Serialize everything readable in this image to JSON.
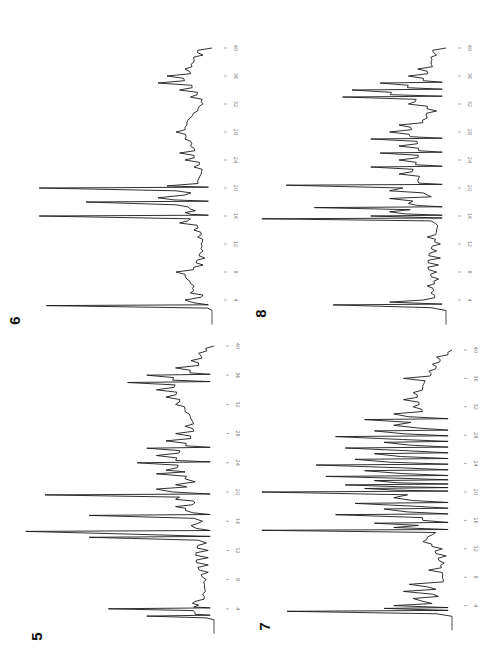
{
  "figure": {
    "orientation": "rotated 90 degrees (time axis vertical, increasing upward)",
    "tick_values": [
      4,
      8,
      12,
      16,
      20,
      24,
      28,
      32,
      36,
      40
    ]
  },
  "chart_data": [
    {
      "type": "line",
      "panel_label": "6",
      "title": "6",
      "xlabel": "",
      "ylabel": "",
      "x_ticks": [
        4,
        8,
        12,
        16,
        20,
        24,
        28,
        32,
        36,
        40
      ],
      "xlim": [
        2,
        42
      ],
      "x": [
        2.5,
        3.2,
        3.6,
        4.0,
        4.4,
        5,
        6,
        7,
        8,
        9,
        10,
        11,
        12,
        13,
        14,
        15,
        15.6,
        16,
        16.5,
        17,
        17.6,
        18,
        18.6,
        19,
        19.6,
        20,
        20.3,
        21,
        22,
        23,
        24,
        25,
        26,
        27,
        28,
        29,
        30,
        31,
        32,
        33,
        34,
        35,
        36,
        37,
        38,
        39,
        40
      ],
      "values": [
        0,
        0.92,
        0.1,
        0.15,
        0.06,
        0.12,
        0.1,
        0.14,
        0.2,
        0.05,
        0.04,
        0.05,
        0.06,
        0.08,
        0.1,
        0.18,
        0.12,
        0.96,
        0.15,
        0.12,
        0.2,
        0.7,
        0.3,
        0.15,
        0.2,
        0.96,
        0.25,
        0.08,
        0.06,
        0.1,
        0.15,
        0.18,
        0.12,
        0.15,
        0.2,
        0.14,
        0.12,
        0.08,
        0.05,
        0.12,
        0.18,
        0.3,
        0.25,
        0.15,
        0.1,
        0.05,
        0.0
      ],
      "values_unit": "relative detector response (0-1)"
    },
    {
      "type": "line",
      "panel_label": "8",
      "title": "8",
      "xlabel": "",
      "ylabel": "",
      "x_ticks": [
        4,
        8,
        12,
        16,
        20,
        24,
        28,
        32,
        36,
        40
      ],
      "xlim": [
        2,
        42
      ],
      "x": [
        2.5,
        3.3,
        3.7,
        4.0,
        5,
        6,
        7,
        8,
        9,
        10,
        11,
        12,
        13,
        14,
        15,
        15.6,
        16,
        16.6,
        17.2,
        17.8,
        18.5,
        19,
        19.6,
        20.4,
        21,
        22,
        23,
        24,
        25,
        26,
        27,
        28,
        29,
        30,
        31,
        32,
        33,
        34,
        35,
        36,
        37,
        38,
        39,
        40
      ],
      "values": [
        0,
        0.6,
        0.3,
        0.12,
        0.08,
        0.1,
        0.04,
        0.05,
        0.04,
        0.03,
        0.05,
        0.03,
        0.1,
        0.05,
        0.06,
        0.98,
        0.4,
        0.3,
        0.7,
        0.2,
        0.3,
        0.1,
        0.3,
        0.85,
        0.15,
        0.25,
        0.4,
        0.25,
        0.35,
        0.25,
        0.4,
        0.3,
        0.25,
        0.1,
        0.05,
        0.2,
        0.55,
        0.5,
        0.35,
        0.2,
        0.15,
        0.08,
        0.05,
        0.0
      ],
      "values_unit": "relative detector response (0-1)"
    },
    {
      "type": "line",
      "panel_label": "5",
      "title": "5",
      "xlabel": "",
      "ylabel": "",
      "x_ticks": [
        4,
        8,
        12,
        16,
        20,
        24,
        28,
        32,
        36,
        40
      ],
      "xlim": [
        2,
        42
      ],
      "x": [
        2.5,
        3.0,
        3.5,
        4.0,
        4.5,
        5,
        6,
        7,
        8,
        9,
        10,
        11,
        12,
        13,
        13.8,
        14.6,
        15.4,
        16,
        16.8,
        17.5,
        18,
        18.5,
        19,
        19.6,
        20.4,
        21,
        21.8,
        22.5,
        23,
        24,
        25,
        26,
        27,
        28,
        29,
        30,
        31,
        32,
        33,
        34,
        35,
        36,
        37,
        38,
        39,
        40
      ],
      "values": [
        0,
        0.35,
        0.1,
        0.55,
        0.08,
        0.1,
        0.06,
        0.05,
        0.04,
        0.03,
        0.03,
        0.03,
        0.03,
        0.04,
        0.65,
        0.98,
        0.12,
        0.06,
        0.65,
        0.15,
        0.2,
        0.1,
        0.2,
        0.88,
        0.3,
        0.2,
        0.15,
        0.3,
        0.25,
        0.4,
        0.3,
        0.35,
        0.25,
        0.2,
        0.15,
        0.12,
        0.15,
        0.2,
        0.25,
        0.3,
        0.45,
        0.35,
        0.2,
        0.12,
        0.08,
        0.0
      ],
      "values_unit": "relative detector response (0-1)"
    },
    {
      "type": "line",
      "panel_label": "7",
      "title": "7",
      "xlabel": "",
      "ylabel": "",
      "x_ticks": [
        4,
        8,
        12,
        16,
        20,
        24,
        28,
        32,
        36,
        40
      ],
      "xlim": [
        2,
        42
      ],
      "x": [
        2.5,
        3.2,
        3.6,
        4.0,
        4.6,
        5,
        5.6,
        6,
        6.6,
        7,
        8,
        9,
        10,
        11,
        12,
        13,
        14,
        14.6,
        15,
        15.6,
        16,
        16.8,
        17.6,
        18.4,
        19.2,
        20,
        20.5,
        21,
        21.6,
        22.2,
        23,
        23.8,
        24.6,
        25.4,
        26.2,
        27,
        27.8,
        28.6,
        29.4,
        30.2,
        31,
        32,
        33,
        34,
        35,
        36,
        37,
        38,
        39,
        40
      ],
      "values": [
        0,
        0.85,
        0.35,
        0.3,
        0.15,
        0.2,
        0.1,
        0.25,
        0.12,
        0.22,
        0.05,
        0.12,
        0.04,
        0.03,
        0.05,
        0.15,
        0.1,
        0.98,
        0.3,
        0.4,
        0.15,
        0.6,
        0.35,
        0.5,
        0.3,
        0.98,
        0.45,
        0.55,
        0.4,
        0.65,
        0.45,
        0.7,
        0.5,
        0.4,
        0.55,
        0.35,
        0.6,
        0.4,
        0.3,
        0.45,
        0.3,
        0.2,
        0.25,
        0.2,
        0.15,
        0.25,
        0.12,
        0.1,
        0.08,
        0.0
      ],
      "values_unit": "relative detector response (0-1)"
    }
  ],
  "panels": [
    {
      "label": "6"
    },
    {
      "label": "8"
    },
    {
      "label": "5"
    },
    {
      "label": "7"
    }
  ]
}
